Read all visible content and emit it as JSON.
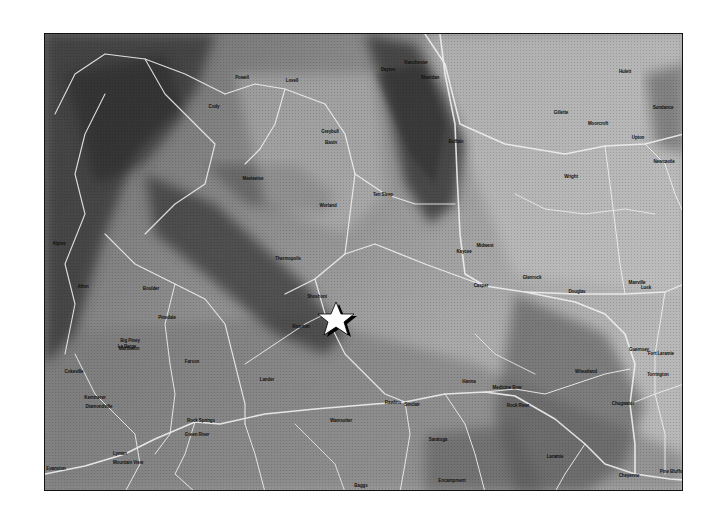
{
  "map": {
    "region": "Wyoming",
    "style": "grayscale shaded relief with road network",
    "colors": {
      "frame": "#111111",
      "roads": "#f2f2f2",
      "marker_fill": "#ffffff",
      "marker_shadow": "#000000"
    },
    "marker": {
      "type": "star",
      "x": 336,
      "y": 319
    },
    "towns": [
      {
        "name": "Powell",
        "x": 241,
        "y": 76
      },
      {
        "name": "Lovell",
        "x": 291,
        "y": 79
      },
      {
        "name": "Cody",
        "x": 213,
        "y": 105
      },
      {
        "name": "Greybull",
        "x": 329,
        "y": 130
      },
      {
        "name": "Basin",
        "x": 330,
        "y": 141
      },
      {
        "name": "Meeteetse",
        "x": 252,
        "y": 177
      },
      {
        "name": "Worland",
        "x": 327,
        "y": 204
      },
      {
        "name": "Ten Sleep",
        "x": 382,
        "y": 193
      },
      {
        "name": "Ranchester",
        "x": 415,
        "y": 61
      },
      {
        "name": "Dayton",
        "x": 387,
        "y": 68
      },
      {
        "name": "Sheridan",
        "x": 429,
        "y": 76
      },
      {
        "name": "Buffalo",
        "x": 455,
        "y": 140
      },
      {
        "name": "Kaycee",
        "x": 463,
        "y": 250
      },
      {
        "name": "Thermopolis",
        "x": 287,
        "y": 257
      },
      {
        "name": "Shoshoni",
        "x": 316,
        "y": 295
      },
      {
        "name": "Riverton",
        "x": 300,
        "y": 325
      },
      {
        "name": "Lander",
        "x": 266,
        "y": 378
      },
      {
        "name": "Gillette",
        "x": 560,
        "y": 111
      },
      {
        "name": "Moorcroft",
        "x": 597,
        "y": 122
      },
      {
        "name": "Sundance",
        "x": 662,
        "y": 106
      },
      {
        "name": "Hulett",
        "x": 624,
        "y": 70
      },
      {
        "name": "Upton",
        "x": 637,
        "y": 136
      },
      {
        "name": "Newcastle",
        "x": 663,
        "y": 160
      },
      {
        "name": "Wright",
        "x": 570,
        "y": 175
      },
      {
        "name": "Midwest",
        "x": 484,
        "y": 244
      },
      {
        "name": "Casper",
        "x": 480,
        "y": 284
      },
      {
        "name": "Glenrock",
        "x": 531,
        "y": 276
      },
      {
        "name": "Douglas",
        "x": 576,
        "y": 290
      },
      {
        "name": "Lusk",
        "x": 645,
        "y": 286
      },
      {
        "name": "Manville",
        "x": 636,
        "y": 281
      },
      {
        "name": "Alpine",
        "x": 58,
        "y": 242
      },
      {
        "name": "Afton",
        "x": 82,
        "y": 285
      },
      {
        "name": "Pinedale",
        "x": 166,
        "y": 316
      },
      {
        "name": "Boulder",
        "x": 150,
        "y": 287
      },
      {
        "name": "Big Piney",
        "x": 129,
        "y": 339
      },
      {
        "name": "Marbleton",
        "x": 128,
        "y": 347
      },
      {
        "name": "La Barge",
        "x": 126,
        "y": 345
      },
      {
        "name": "Farson",
        "x": 191,
        "y": 360
      },
      {
        "name": "Kemmerer",
        "x": 94,
        "y": 396
      },
      {
        "name": "Diamondville",
        "x": 98,
        "y": 405
      },
      {
        "name": "Rock Springs",
        "x": 200,
        "y": 419
      },
      {
        "name": "Green River",
        "x": 196,
        "y": 433
      },
      {
        "name": "Lyman",
        "x": 119,
        "y": 452
      },
      {
        "name": "Mountain View",
        "x": 127,
        "y": 461
      },
      {
        "name": "Evanston",
        "x": 55,
        "y": 467
      },
      {
        "name": "Cokeville",
        "x": 73,
        "y": 370
      },
      {
        "name": "Wamsutter",
        "x": 340,
        "y": 419
      },
      {
        "name": "Rawlins",
        "x": 392,
        "y": 401
      },
      {
        "name": "Sinclair",
        "x": 411,
        "y": 403
      },
      {
        "name": "Saratoga",
        "x": 437,
        "y": 438
      },
      {
        "name": "Encampment",
        "x": 451,
        "y": 479
      },
      {
        "name": "Medicine Bow",
        "x": 506,
        "y": 386
      },
      {
        "name": "Rock River",
        "x": 517,
        "y": 404
      },
      {
        "name": "Laramie",
        "x": 554,
        "y": 455
      },
      {
        "name": "Cheyenne",
        "x": 628,
        "y": 474
      },
      {
        "name": "Pine Bluffs",
        "x": 670,
        "y": 470
      },
      {
        "name": "Wheatland",
        "x": 585,
        "y": 370
      },
      {
        "name": "Chugwater",
        "x": 622,
        "y": 402
      },
      {
        "name": "Guernsey",
        "x": 638,
        "y": 348
      },
      {
        "name": "Fort Laramie",
        "x": 660,
        "y": 352
      },
      {
        "name": "Torrington",
        "x": 657,
        "y": 373
      },
      {
        "name": "Hanna",
        "x": 468,
        "y": 380
      },
      {
        "name": "Baggs",
        "x": 360,
        "y": 484
      }
    ]
  }
}
